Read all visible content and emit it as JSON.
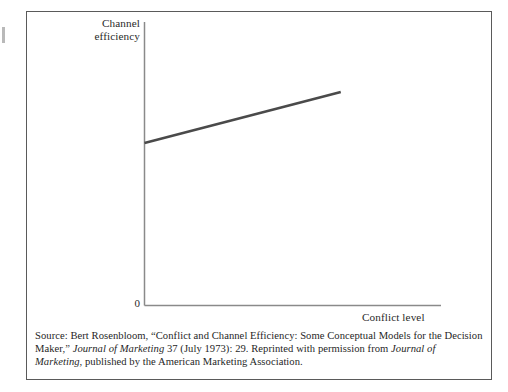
{
  "figure": {
    "background_color": "#ffffff",
    "frame_color": "#5a5a5a",
    "axis_color": "#8a8a8a",
    "line_color": "#4a4a4a",
    "text_color": "#1f1f1f"
  },
  "axes": {
    "y_label_line1": "Channel",
    "y_label_line2": "efficiency",
    "x_label": "Conflict level",
    "origin_label": "0"
  },
  "caption": {
    "part1": "Source: Bert Rosenbloom, “Conflict and Channel Efficiency: Some Conceptual Models for the Decision Maker,” ",
    "journal1": "Journal of Marketing",
    "part2": " 37 (July 1973): 29. Reprinted with permission from ",
    "journal2": "Journal of Marketing",
    "part3": ", published by the American Marketing Association."
  },
  "chart_data": {
    "type": "line",
    "title": "",
    "subtitle": "",
    "xlabel": "Conflict level",
    "ylabel": "Channel efficiency",
    "grid": false,
    "legend_position": "none",
    "axis_tick_labels": {
      "x": [],
      "y": [
        "0"
      ]
    },
    "xlim": [
      0,
      1
    ],
    "ylim": [
      0,
      1
    ],
    "annotations": [],
    "series": [
      {
        "name": "Channel efficiency vs. conflict level",
        "x": [
          0.0,
          0.662
        ],
        "values": [
          0.573,
          0.753
        ],
        "style": "solid",
        "color": "#4a4a4a",
        "width": 2.6
      }
    ]
  }
}
